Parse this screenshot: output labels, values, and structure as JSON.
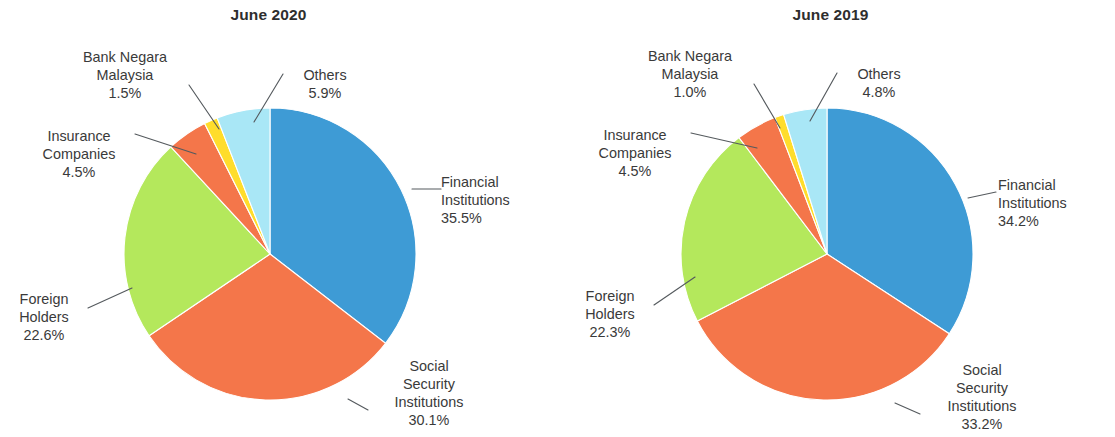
{
  "figure": {
    "background_color": "#ffffff",
    "text_color": "#3a3a3a",
    "leader_color": "#555a5e"
  },
  "palette": {
    "financial_institutions": "#3e9bd5",
    "social_security_institutions": "#f4764a",
    "foreign_holders": "#b4e85c",
    "insurance_companies": "#f4764a",
    "bank_negara_malaysia": "#ffdd2b",
    "others": "#a9e7f6"
  },
  "panels": [
    {
      "id": "june-2020",
      "title": "June 2020",
      "labels": {
        "financial": {
          "name_line1": "Financial",
          "name_line2": "Institutions",
          "pct": "35.5%"
        },
        "social": {
          "name_line1": "Social",
          "name_line2": "Security",
          "name_line3": "Institutions",
          "pct": "30.1%"
        },
        "foreign": {
          "name_line1": "Foreign",
          "name_line2": "Holders",
          "pct": "22.6%"
        },
        "insurance": {
          "name_line1": "Insurance",
          "name_line2": "Companies",
          "pct": "4.5%"
        },
        "bnm": {
          "name_line1": "Bank Negara",
          "name_line2": "Malaysia",
          "pct": "1.5%"
        },
        "others": {
          "name_line1": "Others",
          "pct": "5.9%"
        }
      }
    },
    {
      "id": "june-2019",
      "title": "June 2019",
      "labels": {
        "financial": {
          "name_line1": "Financial",
          "name_line2": "Institutions",
          "pct": "34.2%"
        },
        "social": {
          "name_line1": "Social",
          "name_line2": "Security",
          "name_line3": "Institutions",
          "pct": "33.2%"
        },
        "foreign": {
          "name_line1": "Foreign",
          "name_line2": "Holders",
          "pct": "22.3%"
        },
        "insurance": {
          "name_line1": "Insurance",
          "name_line2": "Companies",
          "pct": "4.5%"
        },
        "bnm": {
          "name_line1": "Bank Negara",
          "name_line2": "Malaysia",
          "pct": "1.0%"
        },
        "others": {
          "name_line1": "Others",
          "pct": "4.8%"
        }
      }
    }
  ],
  "chart_data": [
    {
      "type": "pie",
      "title": "June 2020",
      "labels": [
        "Financial Institutions",
        "Social Security Institutions",
        "Foreign Holders",
        "Insurance Companies",
        "Bank Negara Malaysia",
        "Others"
      ],
      "values": [
        35.5,
        30.1,
        22.6,
        4.5,
        1.5,
        5.9
      ],
      "value_labels": [
        "35.5%",
        "30.1%",
        "22.6%",
        "4.5%",
        "1.5%",
        "5.9%"
      ],
      "colors": [
        "#3e9bd5",
        "#f4764a",
        "#b4e85c",
        "#f4764a",
        "#ffdd2b",
        "#a9e7f6"
      ],
      "units": "percent",
      "start_angle": 0,
      "direction": "clockwise",
      "legend": "none",
      "labels_position": "outside-with-leader-lines",
      "grid": false
    },
    {
      "type": "pie",
      "title": "June 2019",
      "labels": [
        "Financial Institutions",
        "Social Security Institutions",
        "Foreign Holders",
        "Insurance Companies",
        "Bank Negara Malaysia",
        "Others"
      ],
      "values": [
        34.2,
        33.2,
        22.3,
        4.5,
        1.0,
        4.8
      ],
      "value_labels": [
        "34.2%",
        "33.2%",
        "22.3%",
        "4.5%",
        "1.0%",
        "4.8%"
      ],
      "colors": [
        "#3e9bd5",
        "#f4764a",
        "#b4e85c",
        "#f4764a",
        "#ffdd2b",
        "#a9e7f6"
      ],
      "units": "percent",
      "start_angle": 0,
      "direction": "clockwise",
      "legend": "none",
      "labels_position": "outside-with-leader-lines",
      "grid": false
    }
  ]
}
